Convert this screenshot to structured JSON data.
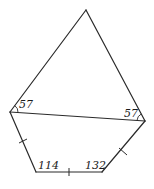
{
  "diagram": {
    "type": "geometry-figure",
    "vertices": {
      "top": [
        86,
        10
      ],
      "left": [
        10,
        112
      ],
      "right": [
        145,
        121
      ],
      "bottom_left": [
        36,
        172
      ],
      "bottom_right": [
        102,
        172
      ]
    },
    "angle_labels": {
      "left_upper": "57",
      "right_upper": "57",
      "bottom_left": "114",
      "bottom_right": "132"
    },
    "equal_side_ticks": [
      "left-to-bottom_left",
      "bottom_left-to-bottom_right",
      "bottom_right-to-right"
    ],
    "line_color": "#2a2a2a"
  }
}
